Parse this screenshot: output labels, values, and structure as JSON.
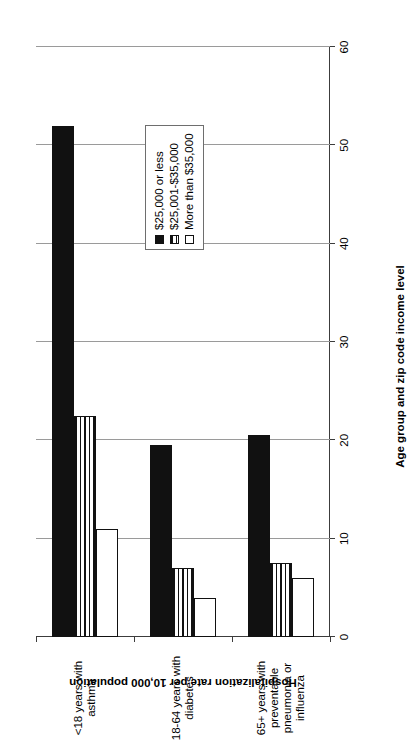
{
  "chart_data": {
    "type": "bar",
    "orientation": "vertical-rendered-sideways",
    "title": "",
    "xlabel": "Age group and zip code income level",
    "ylabel": "Hospitalization rate per 10,000 population",
    "categories": [
      "<18 years with\nasthma",
      "18-64 years with\ndiabetes",
      "65+ years with\npreventable\npneumonia or\ninfluenza"
    ],
    "series": [
      {
        "name": "$25,000 or less",
        "values": [
          52,
          19.5,
          20.5
        ],
        "fill": "solid-black"
      },
      {
        "name": "$25,001-$35,000",
        "values": [
          22.5,
          7,
          7.5
        ],
        "fill": "horizontal-hatch"
      },
      {
        "name": "More than $35,000",
        "values": [
          11,
          4,
          6
        ],
        "fill": "white"
      }
    ],
    "ylim": [
      0,
      60
    ],
    "yticks": [
      0,
      10,
      20,
      30,
      40,
      50,
      60
    ],
    "ytick_labels": [
      "0",
      "10",
      "20",
      "30",
      "40",
      "50",
      "60"
    ],
    "grid": true,
    "legend_position": "right"
  },
  "legend": {
    "items": [
      {
        "label": "$25,000 or less"
      },
      {
        "label": "$25,001-$35,000"
      },
      {
        "label": "More than $35,000"
      }
    ]
  },
  "colors": {
    "series_1": "#111111",
    "series_2": "#ffffff",
    "series_3": "#ffffff",
    "axis": "#3c3c3c",
    "gridline": "#9a9a9a",
    "background": "#ffffff"
  }
}
